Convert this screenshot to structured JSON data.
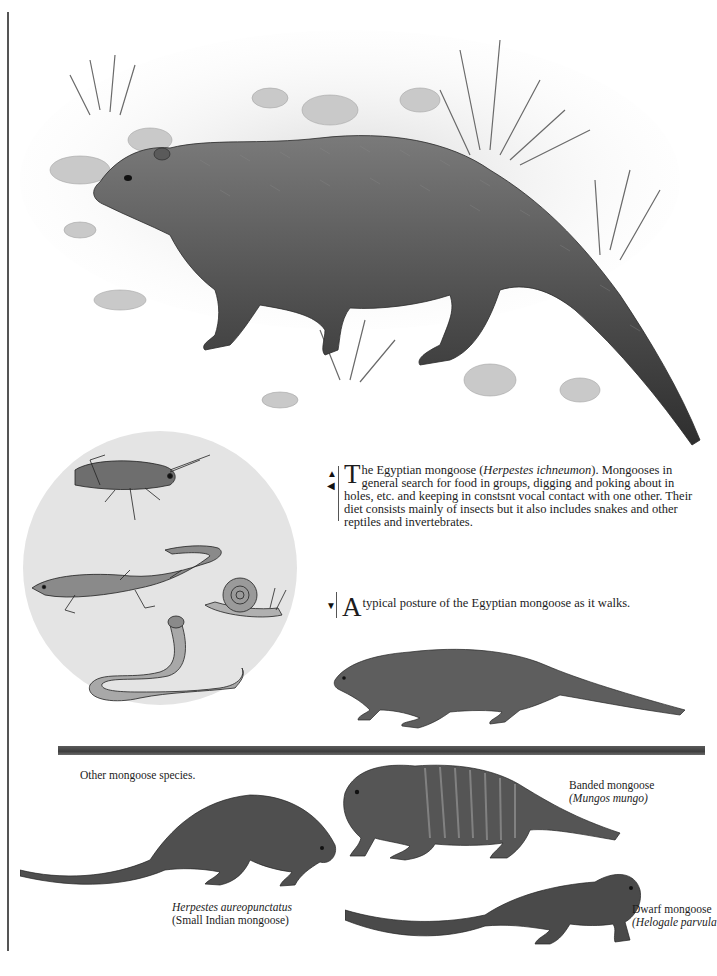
{
  "page": {
    "type": "illustrated book page"
  },
  "illustrations": {
    "main": {
      "name": "egyptian-mongoose-in-habitat",
      "description": "Egyptian mongoose standing among rocks and grass"
    },
    "prey_circle": {
      "name": "prey-circle",
      "items": [
        "grasshopper",
        "lizard",
        "snail",
        "snake"
      ]
    },
    "walking": {
      "name": "egyptian-mongoose-walking"
    },
    "small_indian": {
      "name": "small-indian-mongoose"
    },
    "banded": {
      "name": "banded-mongoose"
    },
    "dwarf": {
      "name": "dwarf-mongoose"
    }
  },
  "captions": {
    "main": {
      "arrows": [
        "▲",
        "◀"
      ],
      "dropcap": "T",
      "lead": "he Egyptian mongoose (",
      "species_italic": "Herpestes ichneumon",
      "body": "). Mongooses in general search for food in groups, digging and poking about in holes, etc. and keeping in constsnt vocal contact with one other. Their diet consists mainly of insects but it also includes snakes and other reptiles and invertebrates."
    },
    "walking": {
      "arrow": "▼",
      "dropcap": "A",
      "body": " typical posture of the Egyptian mongoose as it walks."
    }
  },
  "section_heading": "Other mongoose species.",
  "species_labels": {
    "banded": {
      "common": "Banded mongoose",
      "scientific": "(Mungos mungo)"
    },
    "small_indian": {
      "scientific": "Herpestes aureopunctatus",
      "common": "(Small Indian mongoose)"
    },
    "dwarf": {
      "common": "Dwarf mongoose",
      "scientific": "(Helogale parvula"
    }
  },
  "colors": {
    "text": "#1c1c1c",
    "rule": "#555555",
    "divider": "#4a4a4a",
    "circle_bg": "#e4e4e4"
  }
}
